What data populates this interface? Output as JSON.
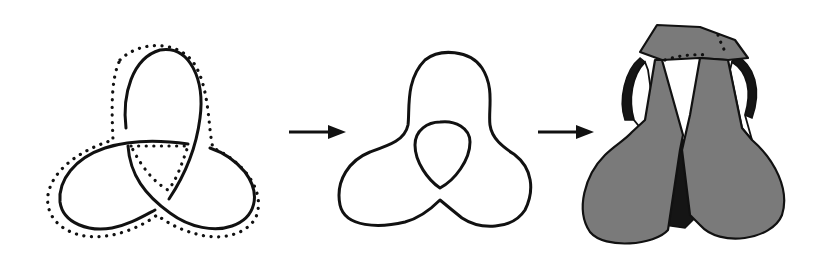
{
  "figure": {
    "description": "Trefoil knot to Seifert circles to Seifert surface",
    "panels": [
      {
        "id": "trefoil-knot",
        "label": "Trefoil knot with dotted outline"
      },
      {
        "id": "seifert-circles",
        "label": "Seifert circles (nested outer and inner curves)"
      },
      {
        "id": "seifert-surface",
        "label": "Shaded Seifert surface with twisted bands"
      }
    ],
    "arrows": [
      {
        "from": "trefoil-knot",
        "to": "seifert-circles"
      },
      {
        "from": "seifert-circles",
        "to": "seifert-surface"
      }
    ]
  },
  "colors": {
    "stroke": "#111111",
    "surface_fill": "#7a7a7a",
    "dark_band": "#151515",
    "background": "#ffffff"
  }
}
